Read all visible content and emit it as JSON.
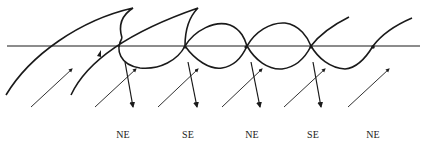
{
  "diagram": {
    "colors": {
      "line": "#1a1a1a",
      "background": "#ffffff"
    },
    "labels": [
      {
        "text": "NE",
        "x": 123
      },
      {
        "text": "SE",
        "x": 188
      },
      {
        "text": "NE",
        "x": 252
      },
      {
        "text": "SE",
        "x": 313
      },
      {
        "text": "NE",
        "x": 373
      }
    ]
  }
}
